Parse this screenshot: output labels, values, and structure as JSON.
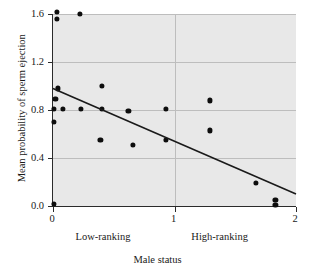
{
  "chart_data": {
    "type": "scatter",
    "title": "",
    "xlabel": "Male status",
    "ylabel": "Mean probability of sperm ejection",
    "xlim": [
      0,
      2
    ],
    "ylim": [
      0,
      1.6
    ],
    "xticks": [
      0,
      1,
      2
    ],
    "xtick_labels": [
      "0",
      "1",
      "2"
    ],
    "yticks": [
      0.0,
      0.4,
      0.8,
      1.2,
      1.6
    ],
    "ytick_labels": [
      "0.0",
      "0.4",
      "0.8",
      "1.2",
      "1.6"
    ],
    "grid": true,
    "legend": "none",
    "plot_background": "#e8e8e8",
    "point_color": "#0d0d0d",
    "line_color": "#1a1a1a",
    "grid_color": "#bdbdbd",
    "axis_color": "#2b2b2b",
    "region_labels": [
      {
        "text": "Low-ranking",
        "x": 0.42
      },
      {
        "text": "High-ranking",
        "x": 1.38
      }
    ],
    "points": [
      {
        "x": 0.03,
        "y": 1.62
      },
      {
        "x": 0.03,
        "y": 1.56
      },
      {
        "x": 0.22,
        "y": 1.6
      },
      {
        "x": 0.04,
        "y": 0.98
      },
      {
        "x": 0.02,
        "y": 0.89
      },
      {
        "x": 0.01,
        "y": 0.81
      },
      {
        "x": 0.08,
        "y": 0.81
      },
      {
        "x": 0.23,
        "y": 0.81
      },
      {
        "x": 0.01,
        "y": 0.7
      },
      {
        "x": 0.4,
        "y": 1.0
      },
      {
        "x": 0.4,
        "y": 0.81
      },
      {
        "x": 0.39,
        "y": 0.55
      },
      {
        "x": 0.62,
        "y": 0.79
      },
      {
        "x": 0.66,
        "y": 0.51
      },
      {
        "x": 0.93,
        "y": 0.81
      },
      {
        "x": 0.93,
        "y": 0.55
      },
      {
        "x": 1.29,
        "y": 0.88
      },
      {
        "x": 1.29,
        "y": 0.63
      },
      {
        "x": 1.67,
        "y": 0.19
      },
      {
        "x": 1.83,
        "y": 0.05
      },
      {
        "x": 1.83,
        "y": 0.01
      },
      {
        "x": 0.01,
        "y": 0.02
      }
    ],
    "trendline": {
      "x1": 0.0,
      "y1": 0.98,
      "x2": 2.0,
      "y2": 0.1
    }
  }
}
